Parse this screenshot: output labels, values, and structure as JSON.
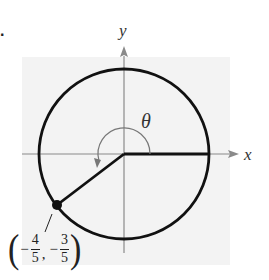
{
  "problem_number": ".",
  "diagram": {
    "type": "unit-circle",
    "axis_labels": {
      "x": "x",
      "y": "y"
    },
    "angle_label": "θ",
    "point": {
      "x_num": "4",
      "x_den": "5",
      "x_sign": "−",
      "y_num": "3",
      "y_den": "5",
      "y_sign": "−",
      "text": "(−4/5, −3/5)"
    },
    "colors": {
      "background_shade": "#f2f2f2",
      "circle": "#111111",
      "axes": "#888888",
      "arc": "#777777"
    }
  }
}
